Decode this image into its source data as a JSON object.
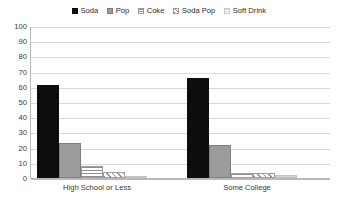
{
  "chart_data": {
    "type": "bar",
    "title": "",
    "subtitle": "",
    "xlabel": "",
    "ylabel": "",
    "ylim": [
      0,
      100
    ],
    "yticks": [
      100,
      90,
      80,
      70,
      60,
      50,
      40,
      30,
      20,
      10,
      0
    ],
    "grid": true,
    "legend_position": "top-center",
    "categories": [
      "High School or Less",
      "Some College"
    ],
    "series": [
      {
        "name": "Soda",
        "values": [
          61,
          66
        ],
        "swatch": "solid-black",
        "color": "#0d0d0d"
      },
      {
        "name": "Pop",
        "values": [
          23,
          22
        ],
        "swatch": "solid-gray",
        "color": "#9c9c9c"
      },
      {
        "name": "Coke",
        "values": [
          8,
          3
        ],
        "swatch": "horizontal-lines",
        "color": "#8f8f8f"
      },
      {
        "name": "Soda Pop",
        "values": [
          4,
          3
        ],
        "swatch": "diagonal-hatch",
        "color": "#8f8f8f"
      },
      {
        "name": "Soft Drink",
        "values": [
          1,
          2
        ],
        "swatch": "light-lines",
        "color": "#d2d2d2"
      }
    ]
  },
  "legend": {
    "items": [
      {
        "label": "Soda"
      },
      {
        "label": "Pop"
      },
      {
        "label": "Coke"
      },
      {
        "label": "Soda Pop"
      },
      {
        "label": "Soft Drink"
      }
    ]
  }
}
